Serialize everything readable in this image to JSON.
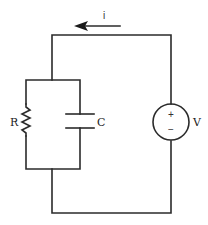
{
  "diagram": {
    "type": "circuit",
    "current_label": "i",
    "current_direction": "left",
    "components": [
      {
        "id": "R",
        "label": "R",
        "kind": "resistor",
        "position": "left branch"
      },
      {
        "id": "C",
        "label": "C",
        "kind": "capacitor",
        "position": "right branch of parallel pair"
      },
      {
        "id": "V",
        "label": "V",
        "kind": "voltage-source",
        "position": "right side",
        "polarity_top": "+",
        "polarity_bottom": "−"
      }
    ],
    "colors": {
      "wire": "#2b2b2b",
      "background": "#ffffff"
    }
  }
}
